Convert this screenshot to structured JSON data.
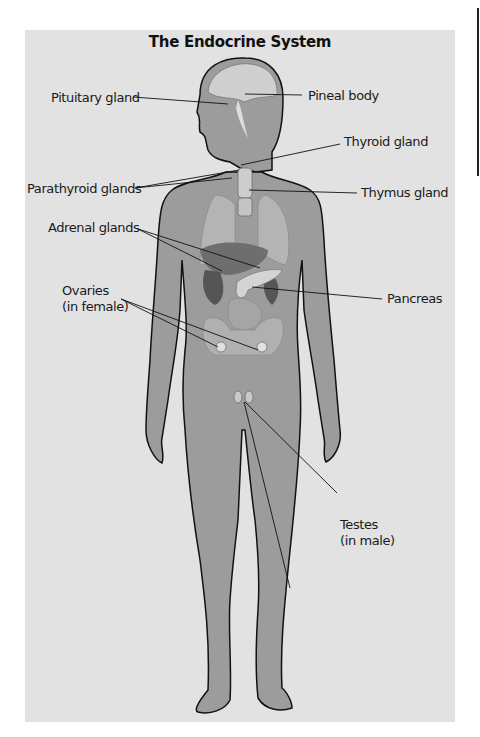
{
  "title": "The Endocrine System",
  "labels": {
    "pituitary": "Pituitary gland",
    "pineal": "Pineal body",
    "thyroid": "Thyroid gland",
    "parathyroid": "Parathyroid glands",
    "thymus": "Thymus gland",
    "adrenal": "Adrenal glands",
    "pancreas": "Pancreas",
    "ovaries_line1": "Ovaries",
    "ovaries_line2": "(in female)",
    "testes_line1": "Testes",
    "testes_line2": "(in male)"
  },
  "colors": {
    "background": "#e2e2e2",
    "body": "#9a9a9a",
    "outline": "#111111"
  }
}
